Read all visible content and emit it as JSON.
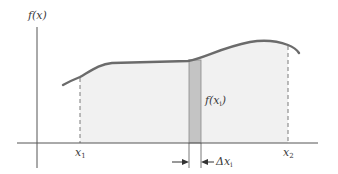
{
  "diagram": {
    "y_axis_label": "f(x)",
    "left_bound_label": "x",
    "left_bound_sub": "1",
    "right_bound_label": "x",
    "right_bound_sub": "2",
    "strip_height_label": "f(x",
    "strip_height_sub": "i",
    "strip_height_close": ")",
    "strip_width_label": "Δx",
    "strip_width_sub": "i"
  },
  "colors": {
    "curve": "#6b6b6b",
    "area_fill": "#f1f1f1",
    "strip_fill": "#c4c4c4",
    "strip_stroke": "#8a8a8a",
    "axes": "#555555",
    "dashed": "#7a7a7a",
    "text": "#3a3a3a"
  }
}
